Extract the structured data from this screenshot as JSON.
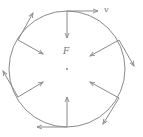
{
  "diagram": {
    "labels": {
      "velocity": "v",
      "force": "F"
    },
    "colors": {
      "line": "#8a8a8a",
      "background": "#ffffff"
    },
    "circle": {
      "cx": 67,
      "cy": 69,
      "r": 58
    },
    "center_dot": true,
    "points": [
      {
        "name": "top",
        "angle_deg": -90
      },
      {
        "name": "upper-right",
        "angle_deg": -30
      },
      {
        "name": "lower-right",
        "angle_deg": 30
      },
      {
        "name": "bottom",
        "angle_deg": 90
      },
      {
        "name": "lower-left",
        "angle_deg": 150
      },
      {
        "name": "upper-left",
        "angle_deg": 210
      }
    ],
    "force_arrow": "radial inward toward center",
    "velocity_arrow": "tangent, clockwise direction"
  }
}
